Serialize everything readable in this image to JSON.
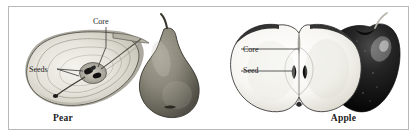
{
  "figure": {
    "panels": [
      {
        "id": "pear",
        "caption": "Pear",
        "subject": "pear",
        "callouts": [
          {
            "label": "Core",
            "target": "pear-core"
          },
          {
            "label": "Seeds",
            "target": "pear-seeds"
          }
        ]
      },
      {
        "id": "apple",
        "caption": "Apple",
        "subject": "apple",
        "callouts": [
          {
            "label": "Core",
            "target": "apple-core"
          },
          {
            "label": "Seed",
            "target": "apple-seed"
          }
        ]
      }
    ]
  },
  "colors": {
    "frame": "#b9b9b9",
    "background": "#ffffff",
    "text": "#1a1a1a",
    "leader_line": "#333333",
    "pear_flesh": "#e8e6df",
    "pear_skin": "#8d8a7e",
    "apple_flesh": "#fbfbf9",
    "apple_skin": "#1d1d1d"
  }
}
